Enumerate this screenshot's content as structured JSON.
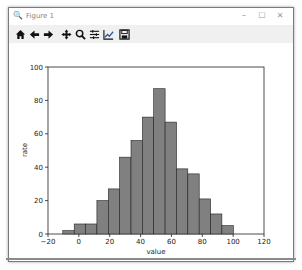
{
  "window": {
    "title": "Figure 1",
    "controls": {
      "minimize": "–",
      "maximize": "☐",
      "close": "✕"
    }
  },
  "toolbar": {
    "buttons": [
      {
        "name": "home-icon",
        "label": "Home"
      },
      {
        "name": "back-icon",
        "label": "Back"
      },
      {
        "name": "forward-icon",
        "label": "Forward"
      },
      {
        "name": "pan-icon",
        "label": "Pan"
      },
      {
        "name": "zoom-icon",
        "label": "Zoom"
      },
      {
        "name": "subplots-icon",
        "label": "Configure subplots"
      },
      {
        "name": "edit-axis-icon",
        "label": "Edit axis"
      },
      {
        "name": "save-icon",
        "label": "Save"
      }
    ]
  },
  "chart_data": {
    "type": "bar",
    "subtype": "histogram",
    "title": "",
    "xlabel": "value",
    "ylabel": "rate",
    "xlim": [
      -20,
      120
    ],
    "ylim": [
      0,
      100
    ],
    "xticks": [
      "−20",
      "0",
      "20",
      "40",
      "60",
      "80",
      "100",
      "120"
    ],
    "yticks": [
      "0",
      "20",
      "40",
      "60",
      "80",
      "100"
    ],
    "bin_edges": [
      -10.4,
      -3.0,
      4.3,
      11.7,
      19.1,
      26.4,
      33.8,
      41.2,
      48.5,
      55.9,
      63.3,
      70.6,
      78.0,
      85.4,
      92.7,
      100.1
    ],
    "values": [
      2,
      6,
      6,
      20,
      27,
      46,
      56,
      70,
      87,
      67,
      39,
      36,
      21,
      12,
      5
    ],
    "bar_color": "#808080",
    "edge_color": "#222222",
    "grid": false,
    "legend": null
  }
}
